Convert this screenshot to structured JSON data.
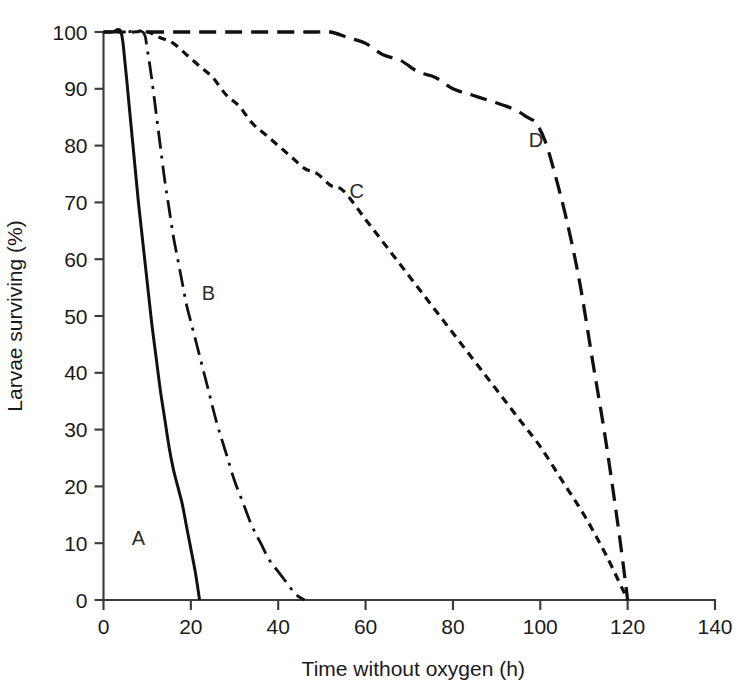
{
  "chart_data": {
    "type": "line",
    "title": "",
    "subtitle": "",
    "xlabel": "Time without oxygen (h)",
    "ylabel": "Larvae surviving (%)",
    "xlim": [
      0,
      140
    ],
    "ylim": [
      0,
      100
    ],
    "xticks": [
      0,
      20,
      40,
      60,
      80,
      100,
      120,
      140
    ],
    "yticks": [
      0,
      10,
      20,
      30,
      40,
      50,
      60,
      70,
      80,
      90,
      100
    ],
    "xtick_labels": [
      "0",
      "20",
      "40",
      "60",
      "80",
      "100",
      "120",
      "140"
    ],
    "ytick_labels": [
      "0",
      "10",
      "20",
      "30",
      "40",
      "50",
      "60",
      "70",
      "80",
      "90",
      "100"
    ],
    "grid": false,
    "legend_position": "inline-annotations",
    "line_color": "#111111",
    "series": [
      {
        "name": "A",
        "label": "A",
        "style": "solid",
        "dasharray": "none",
        "stroke_width": 3.0,
        "label_x": 8,
        "label_y": 11,
        "x": [
          0,
          2,
          4,
          5,
          6,
          7,
          8,
          9,
          10,
          11,
          12,
          13,
          14,
          15,
          16,
          17,
          18,
          19,
          20,
          21,
          22
        ],
        "y": [
          100,
          100,
          100,
          94,
          86,
          78,
          70,
          63,
          56,
          49,
          43,
          37,
          32,
          27,
          23,
          20,
          17,
          13,
          9,
          5,
          0
        ]
      },
      {
        "name": "B",
        "label": "B",
        "style": "dash-dot",
        "dasharray": "18,7,3,7",
        "stroke_width": 2.8,
        "label_x": 24,
        "label_y": 54,
        "x": [
          0,
          5,
          9,
          10,
          11,
          12,
          13,
          14,
          15,
          16,
          17,
          18,
          19,
          20,
          22,
          24,
          26,
          28,
          30,
          32,
          34,
          36,
          38,
          40,
          42,
          44,
          46
        ],
        "y": [
          100,
          100,
          100,
          97,
          92,
          86,
          80,
          74,
          69,
          64,
          60,
          56,
          52,
          49,
          43,
          37,
          31,
          26,
          21,
          17,
          13,
          10,
          7,
          5,
          3,
          1,
          0
        ]
      },
      {
        "name": "C",
        "label": "C",
        "style": "short-dash",
        "dasharray": "8,6",
        "stroke_width": 3.2,
        "label_x": 58,
        "label_y": 72,
        "x": [
          0,
          6,
          10,
          13,
          16,
          19,
          22,
          25,
          28,
          31,
          34,
          37,
          40,
          43,
          46,
          49,
          52,
          55,
          60,
          65,
          70,
          75,
          80,
          85,
          90,
          95,
          100,
          105,
          110,
          115,
          120
        ],
        "y": [
          100,
          100,
          100,
          99,
          98,
          96,
          94,
          92,
          89,
          87,
          84,
          82,
          80,
          78,
          76,
          75,
          73,
          72,
          67,
          62,
          57,
          52,
          47,
          42,
          37,
          32,
          27,
          21,
          15,
          8,
          0
        ]
      },
      {
        "name": "D",
        "label": "D",
        "style": "long-dash",
        "dasharray": "17,9",
        "stroke_width": 3.3,
        "label_x": 99,
        "label_y": 81,
        "x": [
          10,
          20,
          30,
          40,
          48,
          52,
          56,
          60,
          64,
          68,
          72,
          76,
          80,
          84,
          88,
          92,
          95,
          97,
          99,
          101,
          103,
          106,
          109,
          112,
          115,
          118,
          120
        ],
        "y": [
          100,
          100,
          100,
          100,
          100,
          100,
          99,
          98,
          96,
          95,
          93,
          92,
          90,
          89,
          88,
          87,
          86,
          85,
          84,
          81,
          76,
          67,
          56,
          42,
          28,
          12,
          0
        ]
      }
    ]
  }
}
